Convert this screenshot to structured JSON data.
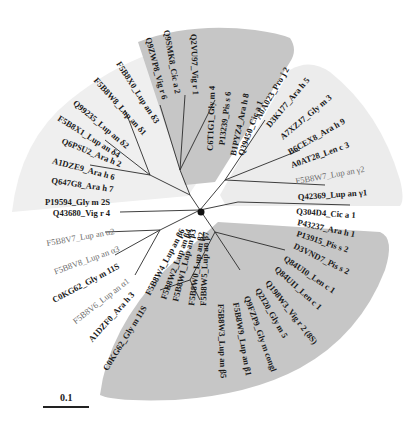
{
  "figure": {
    "type": "unrooted radial phylogenetic tree",
    "scale_bar": {
      "label": "0.1"
    },
    "clades": [
      {
        "name": "2S albumins (upper left)",
        "shade": "#efefef",
        "labels": [
          {
            "text": "F5B8X0_Lup an δ3",
            "style": "black"
          },
          {
            "text": "F5B8W8_Lup an δ1",
            "style": "black"
          },
          {
            "text": "Q99235_Lup an δ2",
            "style": "black"
          },
          {
            "text": "F5B8X1_Lup an δ4",
            "style": "black"
          },
          {
            "text": "Q6PSU2_Ara h 2",
            "style": "black"
          },
          {
            "text": "A1DZE9_Ara h 6",
            "style": "black"
          },
          {
            "text": "Q647G8_Ara h 7",
            "style": "black"
          },
          {
            "text": "P19594_Gly m 2S",
            "style": "black"
          }
        ]
      },
      {
        "name": "vicilin-like (top)",
        "shade": "#c4c4c4",
        "labels": [
          {
            "text": "Q9ZWP8_Vig r 6",
            "style": "black"
          },
          {
            "text": "Q9SMK8_Cic a 2",
            "style": "black"
          },
          {
            "text": "Q2VU97_Vig r 1",
            "style": "black"
          },
          {
            "text": "C6T1G1_Gly m 4",
            "style": "black"
          },
          {
            "text": "P13239_Pis s 6",
            "style": "black"
          },
          {
            "text": "B1PYZ4_Ara h 8",
            "style": "black"
          },
          {
            "text": "Q39450_Cic a 1",
            "style": "black"
          }
        ]
      },
      {
        "name": "nsLTP / conglutin γ (upper right)",
        "shade": "#ececec",
        "labels": [
          {
            "text": "A0A023_Pro j 2",
            "style": "black"
          },
          {
            "text": "D3K177_Ara h 5",
            "style": "black"
          },
          {
            "text": "A7XZJ7_Gly m 3",
            "style": "black"
          },
          {
            "text": "B6CEX8_Ara h 9",
            "style": "black"
          },
          {
            "text": "A0AT28_Len c 3",
            "style": "black"
          },
          {
            "text": "F5B8W7_Lup an γ2",
            "style": "gray"
          },
          {
            "text": "Q42369_Lup an γ1",
            "style": "black"
          }
        ]
      },
      {
        "name": "unshaded 11S legumins (left)",
        "shade": "none",
        "labels": [
          {
            "text": "Q43680_Vig r 4",
            "style": "black"
          },
          {
            "text": "F5B8V7_Lup an α2",
            "style": "gray"
          },
          {
            "text": "F5B8V8_Lup an α3",
            "style": "gray"
          },
          {
            "text": "C0KG62_Gly m 11S",
            "style": "black"
          },
          {
            "text": "F5B8V6_Lup an α1",
            "style": "gray"
          },
          {
            "text": "A1DZF0_Ara h 3",
            "style": "black"
          },
          {
            "text": "C0KG62_Gly m 11S",
            "style": "black"
          }
        ]
      },
      {
        "name": "single outgroup",
        "shade": "none",
        "labels": [
          {
            "text": "Q304D4_Cic a 1",
            "style": "black"
          }
        ]
      },
      {
        "name": "7S vicilins / β-conglutins (bottom)",
        "shade": "#c4c4c4",
        "labels": [
          {
            "text": "P43237_Ara h 1",
            "style": "black"
          },
          {
            "text": "P13915_Pis s 2",
            "style": "black"
          },
          {
            "text": "D3VND7_Pis s 2",
            "style": "black"
          },
          {
            "text": "Q84UI0_Len c 1",
            "style": "black"
          },
          {
            "text": "Q84UI1_Len c 1",
            "style": "black"
          },
          {
            "text": "Q198W3_Vig r 2 (8S)",
            "style": "black"
          },
          {
            "text": "Q2I20_Gly m 5",
            "style": "black"
          },
          {
            "text": "Q9FZP9_Gly m congl",
            "style": "black"
          },
          {
            "text": "F5B8W9_Lup an β1",
            "style": "black"
          },
          {
            "text": "F5B8W3_Lup an β5",
            "style": "black"
          },
          {
            "text": "F5B8W5_Lup an β7",
            "style": "black"
          },
          {
            "text": "F5B8W0_Lup an β2",
            "style": "black"
          },
          {
            "text": "F5B8W1_Lup an β3",
            "style": "black"
          },
          {
            "text": "F5B8W2_Lup an β4",
            "style": "black"
          },
          {
            "text": "F5B8W4_Lup an β6",
            "style": "black"
          }
        ]
      }
    ]
  }
}
